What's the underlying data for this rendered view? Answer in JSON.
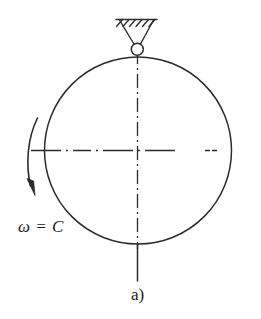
{
  "figure": {
    "panel_label": "a)",
    "angular_velocity_label": "ω = C",
    "title": "",
    "stroke_color": "#2b2b2b",
    "background_color": "#ffffff",
    "elements": {
      "ground_support_icon": "hatched-ground-support",
      "pivot_joint_icon": "pin-joint-circle",
      "disk_icon": "circle-outline",
      "vertical_centerline_icon": "dash-dot-vertical-axis",
      "horizontal_centerline_icon": "dash-dot-horizontal-axis",
      "shaft_icon": "solid-vertical-shaft",
      "rotation_arrow_icon": "curved-rotation-arrow"
    },
    "geometry": {
      "disk_center_x": 138,
      "disk_center_y": 150,
      "disk_radius": 93,
      "pivot_center_x": 137,
      "pivot_center_y": 49,
      "pivot_radius": 5.5,
      "support_bar_y": 19,
      "support_bar_x1": 116,
      "support_bar_x2": 156,
      "hatch_count": 6,
      "shaft_bottom_y": 281,
      "horizontal_axis_x1": 31,
      "horizontal_axis_x2": 234,
      "vertical_axis_y1": 50,
      "vertical_axis_y2": 248,
      "arrow_start_x": 37,
      "arrow_start_y": 118,
      "arrow_end_x": 31,
      "arrow_end_y": 190
    }
  }
}
